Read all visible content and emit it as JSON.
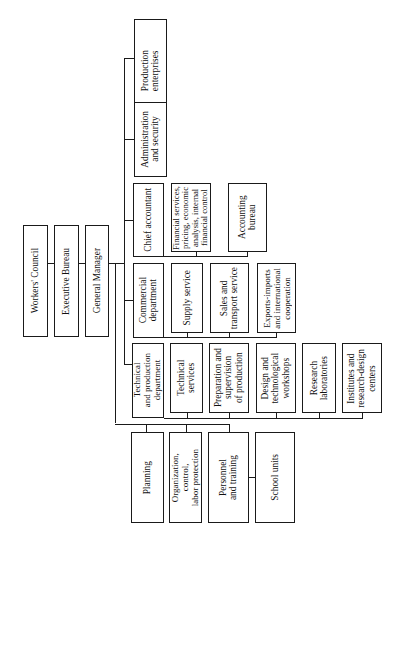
{
  "diagram": {
    "type": "organization-chart",
    "orientation": "rotated-90-ccw",
    "top_chain": [
      {
        "id": "workers_council",
        "label": "Workers' Council"
      },
      {
        "id": "executive_bureau",
        "label": "Executive Bureau"
      },
      {
        "id": "general_manager",
        "label": "General Manager"
      }
    ],
    "departments": {
      "production": {
        "label": "Production\nenterprises"
      },
      "administration": {
        "label": "Administration\nand security"
      },
      "chief_accountant": {
        "label": "Chief accountant",
        "children": [
          {
            "label": "Financial services,\npricing, economic\nanalysis, internal\nfinancial control"
          },
          {
            "label": "Accounting bureau"
          }
        ]
      },
      "commercial": {
        "label": "Commercial\ndepartment",
        "children": [
          {
            "label": "Supply service"
          },
          {
            "label": "Sales and\ntransport service"
          },
          {
            "label": "Exports-imports\nand international\ncooperation"
          }
        ]
      },
      "technical": {
        "label": "Technical\nand production\ndepartment",
        "children": [
          {
            "label": "Technical services"
          },
          {
            "label": "Preparation and\nsupervision\nof production"
          },
          {
            "label": "Design and\ntechnological\nworkshops"
          },
          {
            "label": "Research\nlaboratories"
          },
          {
            "label": "Institutes and\nresearch-design\ncenters"
          }
        ]
      },
      "staff": [
        {
          "label": "Planning"
        },
        {
          "label": "Organization,\ncontrol,\nlabor protection"
        },
        {
          "label": "Personnel\nand training"
        }
      ],
      "school_units": {
        "label": "School units"
      }
    },
    "colors": {
      "line": "#1a1a1a",
      "background": "#ffffff"
    }
  }
}
